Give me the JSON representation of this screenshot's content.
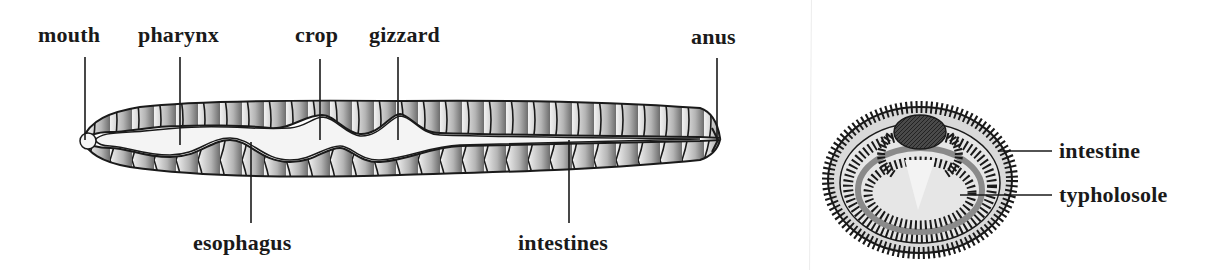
{
  "longitudinal_view": {
    "labels": {
      "mouth": "mouth",
      "pharynx": "pharynx",
      "crop": "crop",
      "gizzard": "gizzard",
      "anus": "anus",
      "esophagus": "esophagus",
      "intestines": "intestines"
    }
  },
  "cross_section_view": {
    "labels": {
      "intestine": "intestine",
      "typhlosole": "typholosole"
    }
  },
  "colors": {
    "ink": "#1a1a1a",
    "body_shade": "#8a8a8a",
    "gut_fill": "#f4f4f4",
    "lumen_dark": "#3a3a3a"
  }
}
